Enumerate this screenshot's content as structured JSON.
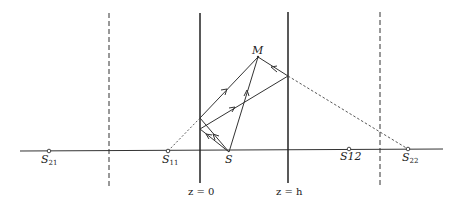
{
  "diagram": {
    "type": "ray-optics",
    "boundaries": [
      {
        "label": "z = 0",
        "x": 200,
        "style": "solid"
      },
      {
        "label": "z = h",
        "x": 288,
        "style": "solid"
      }
    ],
    "image_planes": [
      {
        "x": 109,
        "style": "dashed"
      },
      {
        "x": 380,
        "style": "dashed"
      }
    ],
    "axis_y": 152,
    "points": {
      "S": {
        "label": "S",
        "sub": "",
        "x": 229,
        "y": 152
      },
      "M": {
        "label": "M",
        "sub": "",
        "x": 258,
        "y": 57
      },
      "S11": {
        "label": "S",
        "sub": "11",
        "x": 168,
        "y": 151
      },
      "S21": {
        "label": "S",
        "sub": "21",
        "x": 49,
        "y": 151
      },
      "S12": {
        "label": "S12",
        "sub": "",
        "x": 349,
        "y": 149
      },
      "S22": {
        "label": "S",
        "sub": "22",
        "x": 408,
        "y": 149
      }
    },
    "labels": {
      "z0": "z = 0",
      "zh": "z = h",
      "M": "M",
      "S": "S",
      "S11_base": "S",
      "S11_sub": "11",
      "S21_base": "S",
      "S21_sub": "21",
      "S12": "S12",
      "S22_base": "S",
      "S22_sub": "22"
    }
  }
}
